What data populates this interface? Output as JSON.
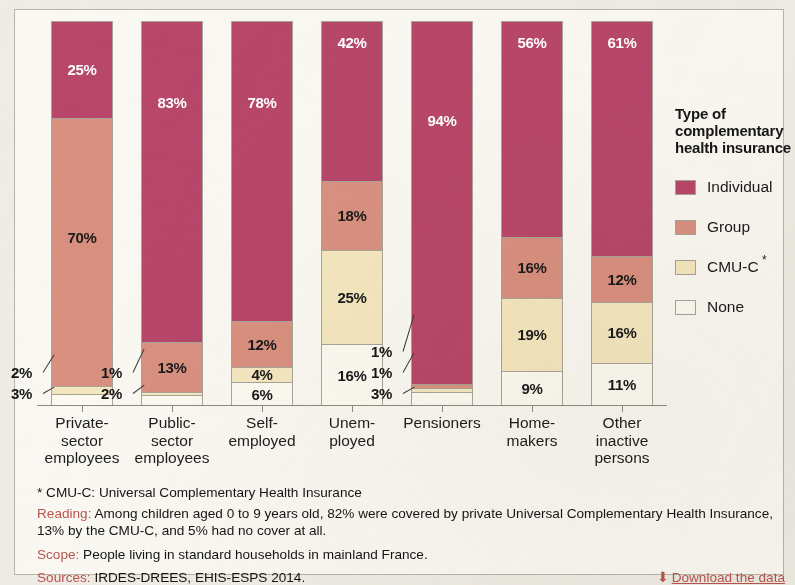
{
  "legend": {
    "title": "Type of complementary health insurance",
    "items": [
      {
        "key": "individual",
        "label": "Individual",
        "color": "#b8476a"
      },
      {
        "key": "group",
        "label": "Group",
        "color": "#d9907f"
      },
      {
        "key": "cmuc",
        "label": "CMU-C",
        "color": "#f4e7bf",
        "marker": "*"
      },
      {
        "key": "none",
        "label": "None",
        "color": "#fcfaf1"
      }
    ]
  },
  "footer": {
    "note": "* CMU-C: Universal Complementary Health Insurance",
    "reading_label": "Reading:",
    "reading_text": " Among children aged 0 to 9 years old, 82% were covered by private Universal Complementary Health Insurance, 13% by the CMU-C, and 5% had no cover at all.",
    "scope_label": "Scope:",
    "scope_text": " People living in standard households in mainland France.",
    "sources_label": "Sources:",
    "sources_text": " IRDES-DREES, EHIS-ESPS 2014.",
    "download_label": "Download the data",
    "download_icon": "download-icon"
  },
  "chart_data": {
    "type": "bar",
    "stacked": true,
    "title": "",
    "xlabel": "",
    "ylabel": "",
    "ylim": [
      0,
      100
    ],
    "grid": false,
    "legend_position": "right",
    "categories": [
      "Private-sector employees",
      "Public-sector employees",
      "Self-employed",
      "Unemployed",
      "Pensioners",
      "Home-makers",
      "Other inactive persons"
    ],
    "category_lines": [
      [
        "Private-",
        "sector",
        "employees"
      ],
      [
        "Public-",
        "sector",
        "employees"
      ],
      [
        "Self-",
        "employed"
      ],
      [
        "Unem-",
        "ployed"
      ],
      [
        "Pensioners"
      ],
      [
        "Home-",
        "makers"
      ],
      [
        "Other",
        "inactive",
        "persons"
      ]
    ],
    "series": [
      {
        "name": "Individual",
        "color": "#b8476a",
        "values": [
          25,
          83,
          78,
          42,
          94,
          56,
          61
        ]
      },
      {
        "name": "Group",
        "color": "#d9907f",
        "values": [
          70,
          13,
          12,
          18,
          1,
          16,
          12
        ]
      },
      {
        "name": "CMU-C",
        "color": "#f4e7bf",
        "values": [
          2,
          1,
          4,
          25,
          1,
          19,
          16
        ]
      },
      {
        "name": "None",
        "color": "#fcfaf1",
        "values": [
          3,
          2,
          6,
          16,
          3,
          9,
          11
        ]
      }
    ],
    "labels": [
      {
        "category": "Private-sector employees",
        "individual": "25%",
        "group": "70%",
        "cmuc": "2%",
        "none": "3%"
      },
      {
        "category": "Public-sector employees",
        "individual": "83%",
        "group": "13%",
        "cmuc": "1%",
        "none": "2%"
      },
      {
        "category": "Self-employed",
        "individual": "78%",
        "group": "12%",
        "cmuc": "4%",
        "none": "6%"
      },
      {
        "category": "Unemployed",
        "individual": "42%",
        "group": "18%",
        "cmuc": "25%",
        "none": "16%"
      },
      {
        "category": "Pensioners",
        "individual": "94%",
        "group": "1%",
        "cmuc": "1%",
        "none": "3%"
      },
      {
        "category": "Home-makers",
        "individual": "56%",
        "group": "16%",
        "cmuc": "19%",
        "none": "9%"
      },
      {
        "category": "Other inactive persons",
        "individual": "61%",
        "group": "12%",
        "cmuc": "16%",
        "none": "11%"
      }
    ]
  }
}
